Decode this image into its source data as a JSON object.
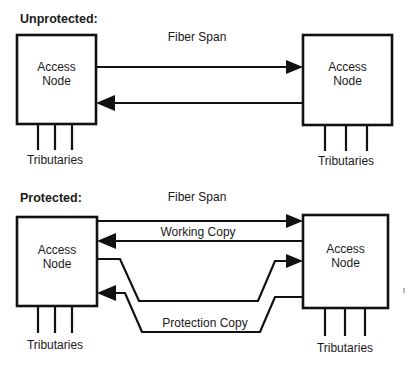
{
  "figure": {
    "type": "network-diagram"
  },
  "sections": [
    {
      "id": "unprotected",
      "title": "Unprotected:",
      "span_label": "Fiber Span",
      "left_node": {
        "line1": "Access",
        "line2": "Node",
        "tributaries_label": "Tributaries"
      },
      "right_node": {
        "line1": "Access",
        "line2": "Node",
        "tributaries_label": "Tributaries"
      },
      "links": [
        {
          "name": "forward-fiber",
          "direction": "left-to-right",
          "label": ""
        },
        {
          "name": "reverse-fiber",
          "direction": "right-to-left",
          "label": ""
        }
      ]
    },
    {
      "id": "protected",
      "title": "Protected:",
      "span_label": "Fiber Span",
      "left_node": {
        "line1": "Access",
        "line2": "Node",
        "tributaries_label": "Tributaries"
      },
      "right_node": {
        "line1": "Access",
        "line2": "Node",
        "tributaries_label": "Tributaries"
      },
      "working_label": "Working Copy",
      "protection_label": "Protection Copy",
      "links": [
        {
          "name": "working-forward",
          "direction": "left-to-right",
          "label": "Working Copy"
        },
        {
          "name": "working-reverse",
          "direction": "right-to-left",
          "label": ""
        },
        {
          "name": "protection-forward",
          "direction": "left-to-right",
          "label": "Protection Copy"
        },
        {
          "name": "protection-reverse",
          "direction": "right-to-left",
          "label": ""
        }
      ]
    }
  ],
  "colors": {
    "line": "#111111",
    "text": "#1a1a1a",
    "background": "#ffffff"
  }
}
